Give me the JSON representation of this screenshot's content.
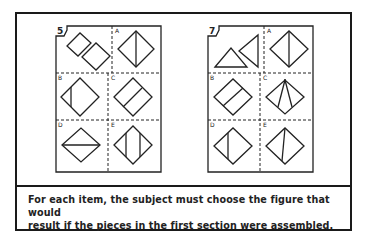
{
  "items": [
    {
      "number": "5",
      "options": [
        "A",
        "B",
        "C",
        "D",
        "E"
      ]
    },
    {
      "number": "7",
      "options": [
        "A",
        "B",
        "C",
        "D",
        "E"
      ]
    }
  ],
  "caption": {
    "line1": "For each item, the subject must choose the figure that would",
    "line2": "result if the pieces in the first section were assembled."
  },
  "colors": {
    "ink": "#1a1a1a",
    "background": "#ffffff"
  }
}
